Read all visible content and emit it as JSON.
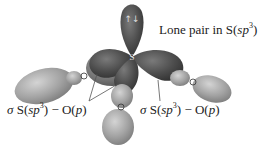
{
  "diagram": {
    "type": "orbital-diagram",
    "central_atom": "S",
    "lone_pair_symbol": "↑↓",
    "labels": {
      "lone_pair": {
        "prefix": "Lone pair in S(",
        "orbital": "sp",
        "sup": "3",
        "suffix": ")"
      },
      "sigma_left": {
        "sigma": "σ",
        "mid": " S(",
        "orbital": "sp",
        "sup": "3",
        "rest": ") − O(",
        "p": "p",
        "end": ")"
      },
      "sigma_right": {
        "sigma": "σ",
        "mid": " S(",
        "orbital": "sp",
        "sup": "3",
        "rest": ") − O(",
        "p": "p",
        "end": ")"
      }
    },
    "colors": {
      "s_lobe_dark": "#4a4a4a",
      "s_lobe_back": "#6e6e6e",
      "o_lobe_light": "#9a9a9a",
      "o_lobe_highlight": "#c8c8c8",
      "leader_line": "#555555",
      "text": "#222222"
    }
  }
}
